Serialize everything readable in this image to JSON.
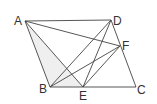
{
  "diagram": {
    "type": "geometry-parallelogram",
    "points": {
      "A": {
        "x": 25,
        "y": 21,
        "label": "A"
      },
      "D": {
        "x": 111,
        "y": 20,
        "label": "D"
      },
      "F": {
        "x": 120,
        "y": 46,
        "label": "F"
      },
      "B": {
        "x": 50,
        "y": 87,
        "label": "B"
      },
      "E": {
        "x": 83,
        "y": 87,
        "label": "E"
      },
      "C": {
        "x": 136,
        "y": 87,
        "label": "C"
      }
    },
    "segments": [
      "AD",
      "AF",
      "AB",
      "AE",
      "DB",
      "DE",
      "DF",
      "FC",
      "FB",
      "FE",
      "BE",
      "EC"
    ],
    "shaded_region": [
      "A",
      "B",
      "E"
    ],
    "colors": {
      "line": "#444444",
      "shade": "#efefef",
      "label": "#333333"
    }
  }
}
